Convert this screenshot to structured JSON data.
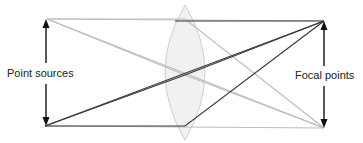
{
  "diagram": {
    "labels": {
      "left": "Point sources",
      "right": "Focal points"
    },
    "colors": {
      "dark_ray": "#3a3a3a",
      "light_ray": "#bdbdbd",
      "lens_fill": "#ececec",
      "lens_stroke": "#cfcfcf",
      "arrow": "#111111"
    },
    "points": {
      "source_top": [
        47,
        19
      ],
      "source_bottom": [
        45,
        126
      ],
      "focal_top": [
        324,
        21
      ],
      "focal_bottom": [
        324,
        128
      ]
    },
    "lens": {
      "cx": 185,
      "top": 5,
      "bottom": 140,
      "half_width": 19
    }
  }
}
